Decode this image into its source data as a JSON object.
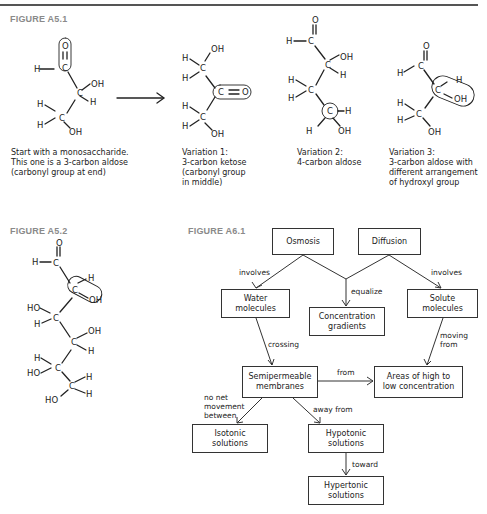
{
  "figures": {
    "a51": {
      "label": "FIGURE A5.1",
      "captions": [
        "Start with a monosaccharide.\nThis one is a 3-carbon aldose\n(carbonyl group at end)",
        "Variation 1:\n3-carbon ketose\n(carbonyl group\nin middle)",
        "Variation 2:\n4-carbon aldose",
        "Variation 3:\n3-carbon aldose with\ndifferent arrangement\nof hydroxyl group"
      ]
    },
    "a52": {
      "label": "FIGURE A5.2"
    },
    "a61": {
      "label": "FIGURE A6.1",
      "nodes": {
        "osmosis": "Osmosis",
        "diffusion": "Diffusion",
        "water": "Water\nmolecules",
        "concentration": "Concentration\ngradients",
        "solute": "Solute\nmolecules",
        "semipermeable": "Semipermeable\nmembranes",
        "areas": "Areas of high to\nlow concentration",
        "isotonic": "Isotonic\nsolutions",
        "hypotonic": "Hypotonic\nsolutions",
        "hypertonic": "Hypertonic\nsolutions"
      },
      "edges": {
        "involves_left": "involves",
        "equalize": "equalize",
        "involves_right": "involves",
        "crossing": "crossing",
        "moving_from": "moving\nfrom",
        "from": "from",
        "no_net": "no net\nmovement\nbetween",
        "away_from": "away from",
        "toward": "toward"
      }
    }
  },
  "atoms": {
    "H": "H",
    "O": "O",
    "C": "C",
    "OH": "OH",
    "HO": "HO"
  }
}
